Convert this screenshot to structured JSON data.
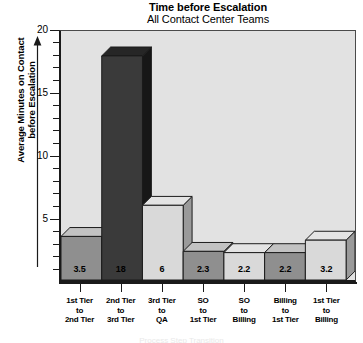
{
  "chart_data": {
    "type": "bar",
    "title": "Time before Escalation",
    "subtitle": "All Contact Center Teams",
    "xlabel": "",
    "ylabel": "Average Minutes on Contact before Escalation",
    "ylabel_lines": [
      "Average Minutes on Contact",
      "before Escalation"
    ],
    "categories": [
      "1st Tier to 2nd Tier",
      "2nd Tier to 3rd Tier",
      "3rd Tier to QA",
      "SO to 1st Tier",
      "SO to Billing",
      "Billing to 1st Tier",
      "1st Tier to Billing"
    ],
    "category_lines": [
      [
        "1st Tier",
        "to",
        "2nd Tier"
      ],
      [
        "2nd Tier",
        "to",
        "3rd Tier"
      ],
      [
        "3rd Tier",
        "to",
        "QA"
      ],
      [
        "SO",
        "to",
        "1st Tier"
      ],
      [
        "SO",
        "to",
        "Billing"
      ],
      [
        "Billing",
        "to",
        "1st Tier"
      ],
      [
        "1st Tier",
        "to",
        "Billing"
      ]
    ],
    "values": [
      3.5,
      18,
      6,
      2.3,
      2.2,
      2.2,
      3.2
    ],
    "value_labels": [
      "3.5",
      "18",
      "6",
      "2.3",
      "2.2",
      "2.2",
      "3.2"
    ],
    "ylim": [
      0,
      20
    ],
    "ytick_labels": [
      "20",
      "15",
      "10",
      "5"
    ],
    "ytick_values": [
      20,
      15,
      10,
      5
    ],
    "minor_tick_step": 1,
    "grid": false,
    "legend": "none",
    "bar_colors": [
      "#8f8f8f",
      "#3a3a3a",
      "#d9d9d9",
      "#8f8f8f",
      "#d9d9d9",
      "#8f8f8f",
      "#d9d9d9"
    ],
    "bar_top_colors": [
      "#c2c2c2",
      "#262626",
      "#e4e4e4",
      "#c2c2c2",
      "#e4e4e4",
      "#c2c2c2",
      "#e4e4e4"
    ],
    "bar_side_colors": [
      "#6e6e6e",
      "#171717",
      "#9a9a9a",
      "#6e6e6e",
      "#9a9a9a",
      "#6e6e6e",
      "#9a9a9a"
    ],
    "plot_background": "#e2e2e2",
    "axis_color": "#1a1a1a"
  },
  "footer": {
    "cutoff_text": "Process Step Transition"
  }
}
